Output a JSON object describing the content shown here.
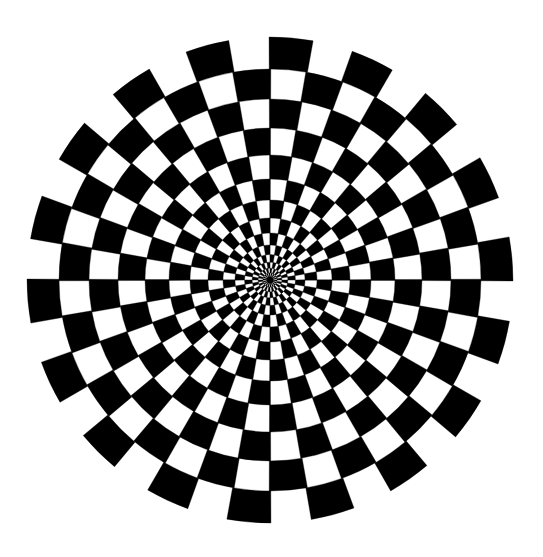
{
  "image": {
    "title": "Radial checkerboard optical illusion",
    "kind": "optical-illusion-figure",
    "width": 543,
    "height": 557,
    "background_color": "#ffffff"
  },
  "figure": {
    "name": "radial-checkerboard",
    "center_x": 270,
    "center_y": 280,
    "max_radius": 243,
    "sector_count": 36,
    "sector_angle_degrees": 10,
    "start_angle_degrees": 0,
    "ring_count": 15,
    "ring_radii": [
      0,
      3.2,
      7.0,
      11.8,
      17.8,
      25.4,
      35.0,
      47.0,
      62.0,
      80.0,
      101.0,
      125.0,
      152.0,
      181.0,
      211.0,
      243.0
    ],
    "scallop": {
      "enabled": true,
      "outer_ring_index": 14,
      "inner_cut_radius": 211,
      "pattern_note": "In the outermost band only the cells whose parity is black extend to the full radius; white cells of that band are blank, producing the petal/scalloped silhouette."
    },
    "colors": {
      "fill_dark": "#000000",
      "fill_light": "#ffffff",
      "canvas": "#ffffff"
    },
    "parity_rule": "(ring_index + sector_index) % 2 === 0 -> dark cell",
    "parity_offset": 0
  }
}
